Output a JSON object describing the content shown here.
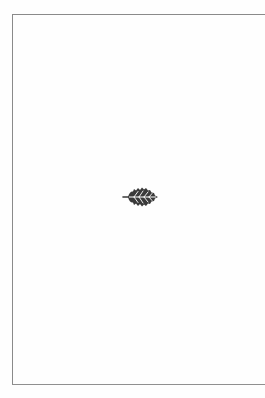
{
  "page": {
    "type": "blank-ornamental-page",
    "background_color": "#fefefe",
    "frame": {
      "sides": [
        "top",
        "left",
        "bottom"
      ],
      "color": "#8a8a8a"
    },
    "ornament": {
      "icon": "leaf-fleuron-icon",
      "color": "#3a3a3a",
      "vein_color": "#ffffff"
    }
  }
}
